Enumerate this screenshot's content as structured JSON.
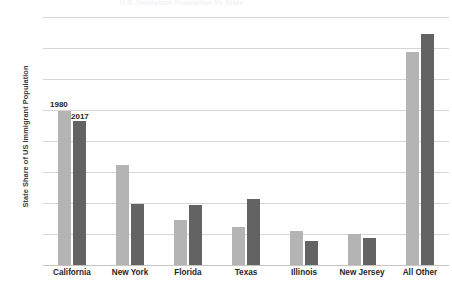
{
  "chart_data": {
    "type": "bar",
    "title": "",
    "xlabel": "",
    "ylabel": "State Share of US Immigrant Population",
    "ylim": [
      0,
      40
    ],
    "ytick_labels": [
      "40%",
      "35%",
      "30%",
      "25%",
      "20%",
      "15%",
      "10%",
      "5%",
      "0%"
    ],
    "ytick_values": [
      40,
      35,
      30,
      25,
      20,
      15,
      10,
      5,
      0
    ],
    "grid": true,
    "legend_position": "inline-data-labels",
    "categories": [
      "California",
      "New York",
      "Florida",
      "Texas",
      "Illinois",
      "New Jersey",
      "All Other"
    ],
    "series": [
      {
        "name": "1980",
        "color": "#b4b4b4",
        "values": [
          24.8,
          16.2,
          7.3,
          6.2,
          5.5,
          5.0,
          34.3
        ]
      },
      {
        "name": "2017",
        "color": "#636363",
        "values": [
          23.2,
          9.9,
          9.7,
          10.7,
          3.9,
          4.3,
          37.3
        ]
      }
    ],
    "annotations": [
      {
        "text": "1980",
        "series": "1980"
      },
      {
        "text": "2017",
        "series": "2017"
      }
    ]
  },
  "colors": {
    "series_1980": "#b4b4b4",
    "series_2017": "#636363",
    "gridline": "#d6d6d6",
    "axis": "#c4c4c4",
    "text": "#262626",
    "background": "#ffffff"
  },
  "title_remnant": "U.S. Immigrant Population by State"
}
